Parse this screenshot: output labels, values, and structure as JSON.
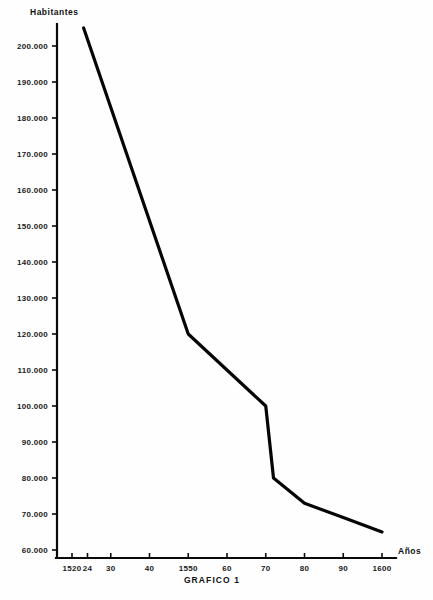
{
  "caption": "GRAFICO 1",
  "chart_data": {
    "type": "line",
    "title": "GRAFICO 1",
    "xlabel": "Años",
    "ylabel": "Habitantes",
    "x": [
      1523,
      1550,
      1570,
      1572,
      1580,
      1590,
      1600
    ],
    "values": [
      205000,
      120000,
      100000,
      80000,
      73000,
      69000,
      65000
    ],
    "xlim": [
      1516,
      1605
    ],
    "ylim": [
      55000,
      208000
    ],
    "grid": false,
    "legend": "none",
    "y_ticks": [
      {
        "value": 200000,
        "label": "200.000"
      },
      {
        "value": 190000,
        "label": "190.000"
      },
      {
        "value": 180000,
        "label": "180.000"
      },
      {
        "value": 170000,
        "label": "170.000"
      },
      {
        "value": 160000,
        "label": "160.000"
      },
      {
        "value": 150000,
        "label": "150.000"
      },
      {
        "value": 140000,
        "label": "140.000"
      },
      {
        "value": 130000,
        "label": "130.000"
      },
      {
        "value": 120000,
        "label": "120.000"
      },
      {
        "value": 110000,
        "label": "110.000"
      },
      {
        "value": 100000,
        "label": "100.000"
      },
      {
        "value": 90000,
        "label": "90.000"
      },
      {
        "value": 80000,
        "label": "80.000"
      },
      {
        "value": 70000,
        "label": "70.000"
      },
      {
        "value": 60000,
        "label": "60.000"
      }
    ],
    "x_ticks": [
      {
        "value": 1520,
        "label": "1520"
      },
      {
        "value": 1524,
        "label": "24"
      },
      {
        "value": 1530,
        "label": "30"
      },
      {
        "value": 1540,
        "label": "40"
      },
      {
        "value": 1550,
        "label": "1550"
      },
      {
        "value": 1560,
        "label": "60"
      },
      {
        "value": 1570,
        "label": "70"
      },
      {
        "value": 1580,
        "label": "80"
      },
      {
        "value": 1590,
        "label": "90"
      },
      {
        "value": 1600,
        "label": "1600"
      }
    ]
  },
  "colors": {
    "line": "#050505",
    "axis": "#0a0a0a",
    "text": "#111111",
    "background": "#fefefe"
  }
}
